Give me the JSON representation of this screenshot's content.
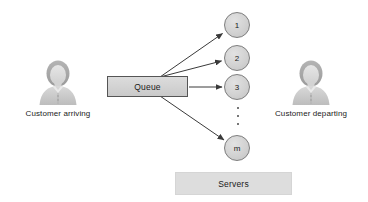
{
  "diagram": {
    "type": "queueing-system-diagram",
    "background_color": "#ffffff"
  },
  "actors": {
    "arriving": {
      "label": "Customer arriving",
      "icon": "person-icon",
      "position": "left"
    },
    "departing": {
      "label": "Customer departing",
      "icon": "person-icon",
      "position": "right"
    }
  },
  "queue": {
    "label": "Queue",
    "fill_color": "#d4d4d4",
    "border_color": "#555555"
  },
  "servers_group": {
    "label": "Servers",
    "fill_color": "#dddddd"
  },
  "server_nodes": [
    {
      "label": "1"
    },
    {
      "label": "2"
    },
    {
      "label": "3"
    },
    {
      "label": "m"
    }
  ],
  "ellipsis": {
    "dot_count": 3,
    "meaning": "continuation between server 3 and server m"
  },
  "connectors": [
    {
      "from": "queue",
      "to": "server-1",
      "style": "arrow"
    },
    {
      "from": "queue",
      "to": "server-2",
      "style": "arrow"
    },
    {
      "from": "queue",
      "to": "server-3",
      "style": "arrow"
    },
    {
      "from": "queue",
      "to": "server-m",
      "style": "arrow"
    }
  ]
}
